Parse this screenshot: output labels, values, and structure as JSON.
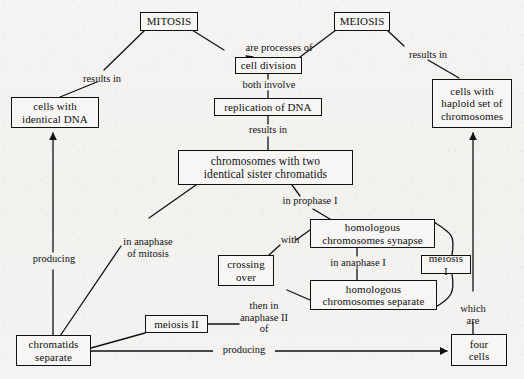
{
  "diagram": {
    "type": "concept-map",
    "background_color": "#f4f3f1",
    "ink_color": "#111111"
  },
  "nodes": [
    {
      "id": "mitosis",
      "label": "MITOSIS"
    },
    {
      "id": "meiosis",
      "label": "MEIOSIS"
    },
    {
      "id": "cell-division",
      "label": "cell division"
    },
    {
      "id": "replication-of-dna",
      "label": "replication of DNA"
    },
    {
      "id": "cells-identical-dna",
      "label": "cells with\nidentical DNA"
    },
    {
      "id": "cells-haploid",
      "label": "cells with\nhaploid set of\nchromosomes"
    },
    {
      "id": "chromosomes-two-chromatids",
      "label": "chromosomes with two\nidentical sister chromatids"
    },
    {
      "id": "homologous-synapse",
      "label": "homologous\nchromosomes synapse"
    },
    {
      "id": "homologous-separate",
      "label": "homologous\nchromosomes separate"
    },
    {
      "id": "crossing-over",
      "label": "crossing\nover"
    },
    {
      "id": "meiosis-i",
      "label": "meiosis I"
    },
    {
      "id": "meiosis-ii",
      "label": "meiosis II"
    },
    {
      "id": "chromatids-separate",
      "label": "chromatids\nseparate"
    },
    {
      "id": "four-cells",
      "label": "four\ncells"
    }
  ],
  "edge_labels": [
    {
      "id": "are-processes-of",
      "text": "are processes of"
    },
    {
      "id": "results-in-left",
      "text": "results in"
    },
    {
      "id": "results-in-right",
      "text": "results in"
    },
    {
      "id": "both-involve",
      "text": "both involve"
    },
    {
      "id": "results-in-center",
      "text": "results in"
    },
    {
      "id": "in-prophase-i",
      "text": "in prophase I"
    },
    {
      "id": "in-anaphase-of-mitosis",
      "text": "in anaphase\nof mitosis"
    },
    {
      "id": "with",
      "text": "with"
    },
    {
      "id": "in-anaphase-i",
      "text": "in anaphase I"
    },
    {
      "id": "then-in-anaphase-ii-of",
      "text": "then in\nanaphase II\nof"
    },
    {
      "id": "producing-left",
      "text": "producing"
    },
    {
      "id": "producing-bottom",
      "text": "producing"
    },
    {
      "id": "which-are",
      "text": "which\nare"
    }
  ]
}
